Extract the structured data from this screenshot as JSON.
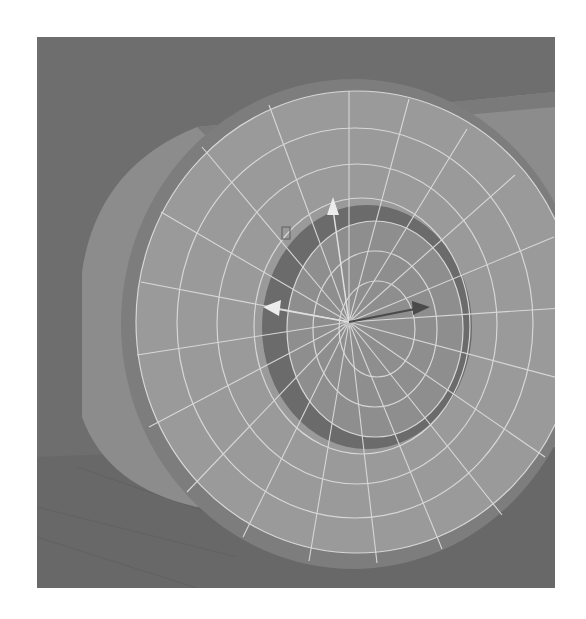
{
  "viewport": {
    "label": "3D viewport - wheel mesh with move manipulator",
    "selected_object": "tire-mesh",
    "tool": "move-manipulator",
    "display_mode": "wireframe-on-shaded"
  },
  "colors": {
    "background": "#6f6f6f",
    "floor": "#6a6a6a",
    "body": "#8d8d8d",
    "body_top": "#9a9a9a",
    "tire_face": "#9b9b9b",
    "groove": "#6c6c6c",
    "hub": "#8f8f8f",
    "wire": "#d9d9d9",
    "arrow_light": "#e8e8e8",
    "arrow_dark": "#4a4a4a"
  },
  "manipulator": {
    "center": [
      312,
      285
    ],
    "axes": [
      {
        "name": "up-axis",
        "tip": [
          296,
          160
        ]
      },
      {
        "name": "left-axis",
        "tip": [
          228,
          270
        ]
      },
      {
        "name": "right-axis",
        "tip": [
          392,
          270
        ]
      }
    ]
  }
}
